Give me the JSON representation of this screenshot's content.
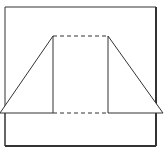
{
  "diagram": {
    "type": "geometric-net",
    "colors": {
      "background": "#ffffff",
      "stroke": "#222222"
    },
    "frame": {
      "x1": 5,
      "y1": 7,
      "x2": 156,
      "y2": 146
    },
    "apex_left": {
      "x": 53,
      "y": 36
    },
    "apex_right": {
      "x": 108,
      "y": 36
    },
    "base_y": 113,
    "base_left_x": 0,
    "base_right_x": 163
  }
}
